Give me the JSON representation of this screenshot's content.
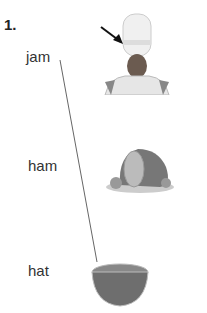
{
  "exercise": {
    "number": "1.",
    "words": [
      {
        "label": "jam"
      },
      {
        "label": "ham"
      },
      {
        "label": "hat"
      }
    ],
    "pictures": [
      {
        "name": "drum-major-hat",
        "description": "person wearing tall white hat with arrow pointing to hat"
      },
      {
        "name": "ham",
        "description": "roast ham on plate"
      },
      {
        "name": "jam",
        "description": "bowl of jam"
      }
    ],
    "match_line": {
      "from": "jam",
      "to": "bowl of jam"
    }
  }
}
